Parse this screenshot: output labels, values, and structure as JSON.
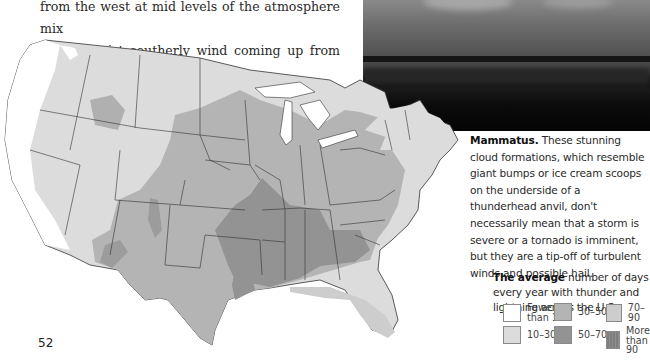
{
  "page": {
    "number": "52"
  },
  "body_text": {
    "lines": [
      "from the west at mid levels of the atmosphere mix",
      "with a moist southerly wind coming up from the"
    ]
  },
  "photo": {
    "subject": "mammatus-clouds-over-marsh-photo"
  },
  "caption": {
    "lead": "Mammatus.",
    "text": " These stunning cloud formations, which resemble giant bumps or ice cream scoops on the underside of a thunderhead anvil, don't necessarily mean that a storm is severe or a tornado is imminent, but they are a tip-off of turbulent winds and possible hail."
  },
  "map": {
    "title_lead": "The average",
    "title_text": " number of days every year with thunder and lightning across the U.S.",
    "region": "Contiguous United States",
    "colors": {
      "fewer_than_10": "#ffffff",
      "10_30": "#dcdcdc",
      "30_50": "#b4b4b4",
      "50_70": "#9a9a9a",
      "70_90": "#c8c8c8",
      "more_than_90": "#8c8c8c",
      "state_border": "#333333"
    },
    "legend": [
      {
        "label_line1": "Fewer",
        "label_line2": "than 10",
        "color": "#ffffff"
      },
      {
        "label_line1": "10–30",
        "label_line2": "",
        "color": "#dcdcdc"
      },
      {
        "label_line1": "30–50",
        "label_line2": "",
        "color": "#b4b4b4"
      },
      {
        "label_line1": "50–70",
        "label_line2": "",
        "color": "#939393"
      },
      {
        "label_line1": "70–90",
        "label_line2": "",
        "color": "#cdcdcd"
      },
      {
        "label_line1": "More",
        "label_line2": "than 90",
        "color": "#7e7e7e"
      }
    ]
  }
}
